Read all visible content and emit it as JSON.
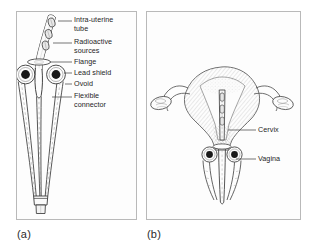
{
  "figure": {
    "background_color": "#ffffff",
    "frame_color": "#b9b9b9",
    "ink_color": "#2b2b2b",
    "panels": [
      {
        "id": "a",
        "caption": "(a)",
        "description": "Manchester-type intra-uterine applicator set",
        "callouts": [
          {
            "id": "intra-uterine-tube",
            "label": "Intra-uterine\ntube",
            "text_x": 74,
            "text_y": 17,
            "leader_x1": 58,
            "leader_y1": 21,
            "leader_x2": 72,
            "leader_y2": 21
          },
          {
            "id": "radioactive-sources",
            "label": "Radioactive\nsources",
            "text_x": 74,
            "text_y": 39,
            "leader_x1": 53,
            "leader_y1": 43,
            "leader_x2": 72,
            "leader_y2": 43
          },
          {
            "id": "flange",
            "label": "Flange",
            "text_x": 74,
            "text_y": 59,
            "leader_x1": 57,
            "leader_y1": 62,
            "leader_x2": 72,
            "leader_y2": 62
          },
          {
            "id": "lead-shield",
            "label": "Lead shield",
            "text_x": 74,
            "text_y": 70,
            "leader_x1": 60,
            "leader_y1": 73,
            "leader_x2": 72,
            "leader_y2": 73
          },
          {
            "id": "ovoid",
            "label": "Ovoid",
            "text_x": 74,
            "text_y": 81,
            "leader_x1": 62,
            "leader_y1": 84,
            "leader_x2": 72,
            "leader_y2": 84
          },
          {
            "id": "flexible-connector",
            "label": "Flexible\nconnector",
            "text_x": 74,
            "text_y": 93,
            "leader_x1": 52,
            "leader_y1": 97,
            "leader_x2": 72,
            "leader_y2": 97
          }
        ]
      },
      {
        "id": "b",
        "caption": "(b)",
        "description": "Applicator in situ within the uterus and vagina",
        "callouts": [
          {
            "id": "cervix",
            "label": "Cervix",
            "text_x": 258,
            "text_y": 126,
            "leader_x1": 232,
            "leader_y1": 130,
            "leader_x2": 256,
            "leader_y2": 130
          },
          {
            "id": "vagina",
            "label": "Vagina",
            "text_x": 258,
            "text_y": 155,
            "leader_x1": 232,
            "leader_y1": 159,
            "leader_x2": 256,
            "leader_y2": 159
          }
        ]
      }
    ]
  }
}
